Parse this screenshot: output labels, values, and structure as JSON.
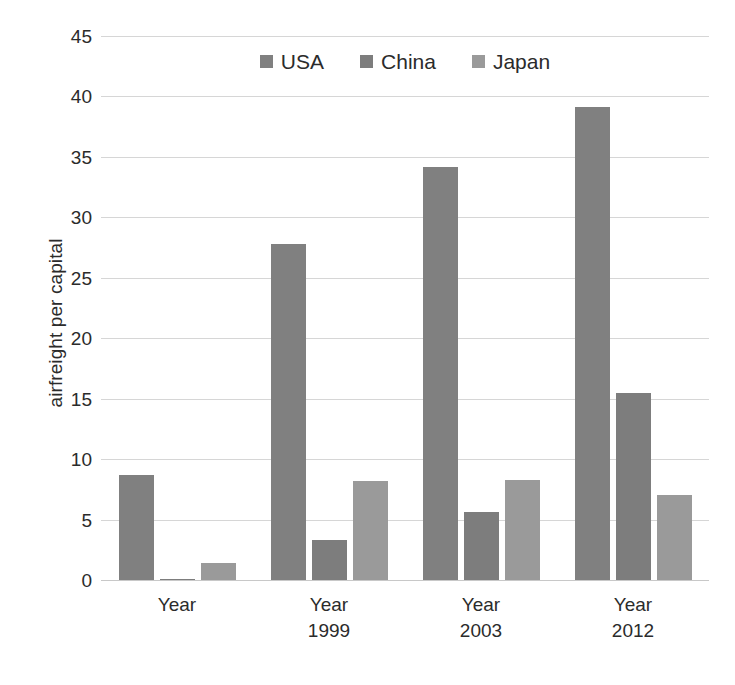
{
  "chart_data": {
    "type": "bar",
    "title": "",
    "subtitle": "",
    "xlabel": "",
    "ylabel": "airfreight per capital",
    "ylim": [
      0,
      45
    ],
    "ytick_step": 5,
    "yticks": [
      "45",
      "40",
      "35",
      "30",
      "25",
      "20",
      "15",
      "10",
      "5",
      "0"
    ],
    "grid": true,
    "legend_position": "top-center",
    "categories": [
      "Year",
      "Year 1999",
      "Year 2003",
      "Year 2012"
    ],
    "category_lines": [
      {
        "line1": "Year",
        "line2": ""
      },
      {
        "line1": "Year",
        "line2": "1999"
      },
      {
        "line1": "Year",
        "line2": "2003"
      },
      {
        "line1": "Year",
        "line2": "2012"
      }
    ],
    "series": [
      {
        "name": "USA",
        "color": "#808080",
        "values": [
          8.7,
          27.8,
          34.2,
          39.1
        ]
      },
      {
        "name": "China",
        "color": "#7d7d7d",
        "values": [
          0.1,
          3.3,
          5.6,
          15.5
        ]
      },
      {
        "name": "Japan",
        "color": "#9a9a9a",
        "values": [
          1.4,
          8.2,
          8.3,
          7.0
        ]
      }
    ]
  },
  "legend": {
    "items": [
      {
        "label": "USA",
        "color": "#808080"
      },
      {
        "label": "China",
        "color": "#7d7d7d"
      },
      {
        "label": "Japan",
        "color": "#9a9a9a"
      }
    ]
  },
  "axis": {
    "y_title": "airfreight per capital"
  },
  "colors": {
    "gridline": "#d6d6d6",
    "text": "#2b2b2b",
    "background": "#ffffff"
  }
}
